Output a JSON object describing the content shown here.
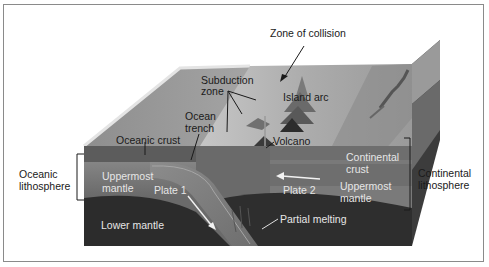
{
  "diagram": {
    "labels": {
      "zone_of_collision": "Zone of collision",
      "subduction_zone_line1": "Subduction",
      "subduction_zone_line2": "zone",
      "island_arc": "Island arc",
      "ocean_trench_line1": "Ocean",
      "ocean_trench_line2": "trench",
      "oceanic_crust": "Oceanic crust",
      "volcano": "Volcano",
      "oceanic_lithosphere_line1": "Oceanic",
      "oceanic_lithosphere_line2": "lithosphere",
      "uppermost_mantle_left_line1": "Uppermost",
      "uppermost_mantle_left_line2": "mantle",
      "plate_1": "Plate 1",
      "plate_2": "Plate 2",
      "continental_crust_line1": "Continental",
      "continental_crust_line2": "crust",
      "uppermost_mantle_right_line1": "Uppermost",
      "uppermost_mantle_right_line2": "mantle",
      "continental_lithosphere_line1": "Continental",
      "continental_lithosphere_line2": "lithosphere",
      "partial_melting": "Partial melting",
      "lower_mantle": "Lower mantle"
    },
    "colors": {
      "surface_ocean": "#9c9c9c",
      "surface_land": "#b4b4b4",
      "crust": "#6e6e6e",
      "uppermost_mantle": "#7c7c7c",
      "lower_mantle": "#2e2e2e",
      "slab": "#8a8a8a",
      "side_face": "#3a3a3a",
      "arrow_light": "#f2f2f2",
      "text_dark": "#1e1e1e",
      "text_light": "#e6e6e6"
    }
  }
}
